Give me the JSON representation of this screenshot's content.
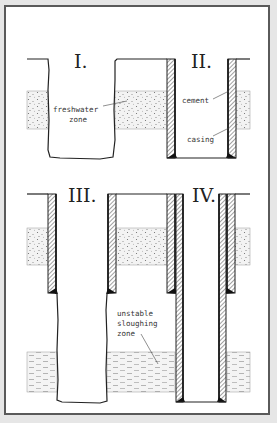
{
  "diagram": {
    "type": "well-casing-cross-sections",
    "panels": [
      {
        "id": "I",
        "label": "I.",
        "description": "open borehole through freshwater zone"
      },
      {
        "id": "II",
        "label": "II.",
        "description": "cased and cemented borehole"
      },
      {
        "id": "III",
        "label": "III.",
        "description": "surface casing with open hole below into sloughing zone"
      },
      {
        "id": "IV",
        "label": "IV.",
        "description": "surface casing plus inner casing through sloughing zone"
      }
    ],
    "labels": {
      "freshwater_zone_line1": "freshwater",
      "freshwater_zone_line2": "zone",
      "cement": "cement",
      "casing": "casing",
      "sloughing_line1": "unstable",
      "sloughing_line2": "sloughing",
      "sloughing_line3": "zone"
    },
    "colors": {
      "background": "#ffffff",
      "frame": "#5a5a5a",
      "line": "#222222",
      "cement_hatch": "#555555",
      "formation_dots": "#777777"
    }
  }
}
